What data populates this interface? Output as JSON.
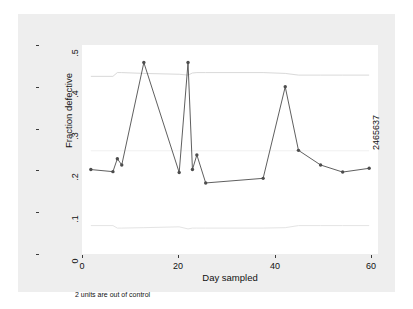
{
  "chart_data": {
    "type": "line",
    "title": "",
    "xlabel": "Day sampled",
    "ylabel": "Fraction defective",
    "xlim": [
      -1,
      66
    ],
    "ylim": [
      0,
      0.5
    ],
    "xticks": [
      0,
      20,
      40,
      60
    ],
    "xtick_labels": [
      "0",
      "20",
      "40",
      "60"
    ],
    "yticks": [
      0,
      0.1,
      0.2,
      0.3,
      0.4,
      0.5
    ],
    "ytick_labels": [
      "0",
      ".1",
      ".2",
      ".3",
      ".4",
      ".5"
    ],
    "grid": false,
    "legend": "none",
    "note": "2 units are out of control",
    "side_label": "2465637",
    "series": [
      {
        "name": "Fraction defective",
        "marker": "filled-circle",
        "color": "#4d4d4d",
        "x": [
          1,
          6,
          7,
          8,
          13,
          21,
          23,
          24,
          25,
          27,
          40,
          45,
          48,
          53,
          58,
          64
        ],
        "values": [
          0.202,
          0.197,
          0.228,
          0.213,
          0.458,
          0.195,
          0.458,
          0.202,
          0.237,
          0.17,
          0.181,
          0.4,
          0.248,
          0.213,
          0.196,
          0.205
        ]
      },
      {
        "name": "Upper control limit",
        "marker": "none",
        "color": "#d9d9d9",
        "x": [
          1,
          6,
          7,
          8,
          13,
          21,
          23,
          24,
          25,
          27,
          40,
          45,
          48,
          53,
          58,
          64
        ],
        "values": [
          0.425,
          0.425,
          0.434,
          0.434,
          0.432,
          0.43,
          0.428,
          0.433,
          0.434,
          0.434,
          0.434,
          0.432,
          0.428,
          0.428,
          0.428,
          0.428
        ]
      },
      {
        "name": "Lower control limit",
        "marker": "none",
        "color": "#e4e4e4",
        "x": [
          1,
          6,
          7,
          8,
          13,
          21,
          23,
          24,
          25,
          27,
          40,
          45,
          48,
          53,
          58,
          64
        ],
        "values": [
          0.068,
          0.068,
          0.062,
          0.062,
          0.063,
          0.065,
          0.06,
          0.062,
          0.062,
          0.062,
          0.062,
          0.063,
          0.068,
          0.068,
          0.068,
          0.068
        ]
      },
      {
        "name": "Center line",
        "marker": "none",
        "color": "#f0f0f0",
        "x": [
          1,
          64
        ],
        "values": [
          0.247,
          0.247
        ]
      }
    ],
    "out_of_control_points": [
      {
        "x": 13,
        "y": 0.458
      },
      {
        "x": 23,
        "y": 0.458
      }
    ],
    "colors": {
      "series_line": "#4d4d4d",
      "control_limit": "#dcdcdc",
      "plot_background": "#ffffff",
      "graph_background": "#eeeeee",
      "axis": "#3b3b3b",
      "text": "#111111"
    }
  }
}
